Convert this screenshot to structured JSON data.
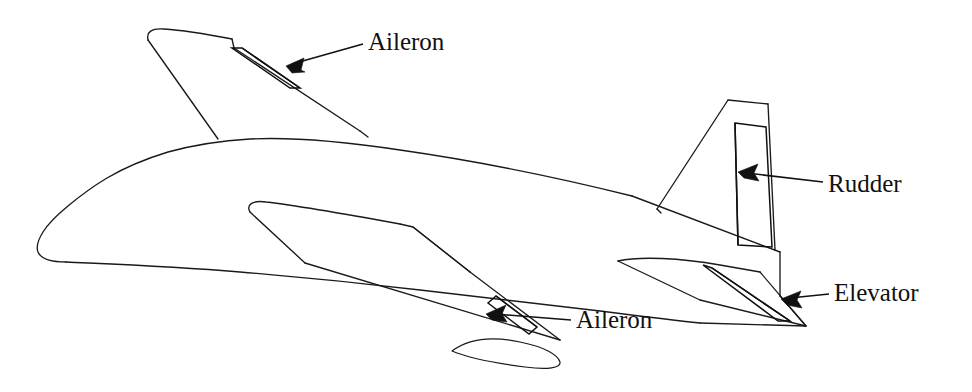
{
  "figure": {
    "view": "three-quarter rear top perspective line drawing",
    "background_color": "#ffffff",
    "line_color": "#1a1a1a",
    "text_color": "#111111"
  },
  "callouts": [
    {
      "id": "aileron-left",
      "label": "Aileron",
      "target": "left-wing-trailing-edge",
      "text_x": 368,
      "text_y": 44,
      "leader_from_x": 363,
      "leader_from_y": 44,
      "leader_to_x": 288,
      "leader_to_y": 66,
      "arrow_direction": "down-left"
    },
    {
      "id": "rudder",
      "label": "Rudder",
      "target": "vertical-stabilizer-trailing-panel",
      "text_x": 828,
      "text_y": 186,
      "leader_from_x": 823,
      "leader_from_y": 182,
      "leader_to_x": 741,
      "leader_to_y": 173,
      "arrow_direction": "left"
    },
    {
      "id": "elevator",
      "label": "Elevator",
      "target": "horizontal-stabilizer-trailing-panel",
      "text_x": 834,
      "text_y": 295,
      "leader_from_x": 829,
      "leader_from_y": 294,
      "leader_to_x": 783,
      "leader_to_y": 299,
      "arrow_direction": "left"
    },
    {
      "id": "aileron-right",
      "label": "Aileron",
      "target": "right-wing-trailing-edge",
      "text_x": 576,
      "text_y": 322,
      "leader_from_x": 571,
      "leader_from_y": 320,
      "leader_to_x": 489,
      "leader_to_y": 315,
      "arrow_direction": "left"
    }
  ],
  "parts": [
    {
      "id": "fuselage",
      "name": "Fuselage"
    },
    {
      "id": "left-wing",
      "name": "Left wing"
    },
    {
      "id": "right-wing",
      "name": "Right wing"
    },
    {
      "id": "vertical-stabilizer",
      "name": "Vertical stabilizer"
    },
    {
      "id": "horizontal-stabilizer",
      "name": "Horizontal stabilizer"
    }
  ]
}
